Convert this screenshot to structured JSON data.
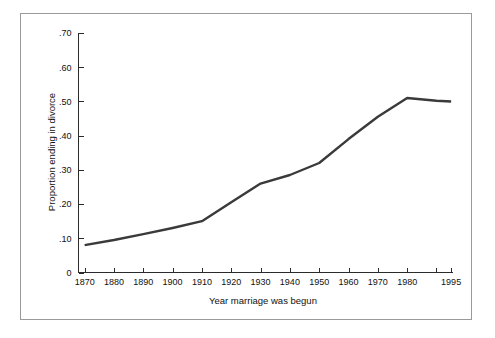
{
  "chart_data": {
    "type": "line",
    "title": "",
    "subtitle": "",
    "xlabel": "Year marriage was begun",
    "ylabel": "Proportion ending in divorce",
    "grid": false,
    "legend": false,
    "legend_position": "none",
    "line_color": "#3a3a3a",
    "background_color": "#ffffff",
    "axis_color": "#2b2b2b",
    "frame_color": "#9a9a9a",
    "xlim": [
      1865,
      1997
    ],
    "ylim": [
      0,
      0.7
    ],
    "x_tick_labels": [
      "1870",
      "1880",
      "1890",
      "1900",
      "1910",
      "1920",
      "1930",
      "1940",
      "1950",
      "1960",
      "1970",
      "1980",
      "",
      "1995"
    ],
    "x_tick_values": [
      1870,
      1880,
      1890,
      1900,
      1910,
      1920,
      1930,
      1940,
      1950,
      1960,
      1970,
      1980,
      1990,
      1995
    ],
    "y_tick_labels": [
      "0",
      ".10",
      ".20",
      ".30",
      ".40",
      ".50",
      ".60",
      ".70"
    ],
    "y_tick_values": [
      0,
      0.1,
      0.2,
      0.3,
      0.4,
      0.5,
      0.6,
      0.7
    ],
    "series": [
      {
        "name": "Proportion ending in divorce",
        "x": [
          1870,
          1880,
          1890,
          1900,
          1910,
          1920,
          1930,
          1940,
          1950,
          1960,
          1970,
          1980,
          1990,
          1995
        ],
        "values": [
          0.08,
          0.095,
          0.112,
          0.13,
          0.15,
          0.205,
          0.26,
          0.285,
          0.32,
          0.39,
          0.455,
          0.51,
          0.502,
          0.5
        ]
      }
    ]
  }
}
